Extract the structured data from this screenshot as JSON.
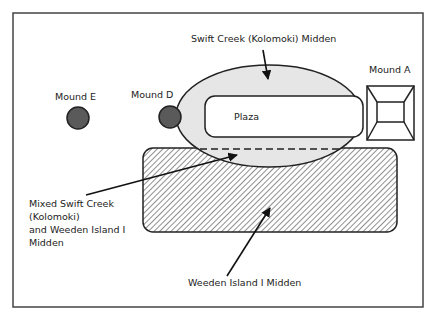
{
  "diagram": {
    "labels": {
      "swift_creek_midden": "Swift Creek (Kolomoki) Midden",
      "mound_a": "Mound A",
      "mound_d": "Mound D",
      "mound_e": "Mound E",
      "plaza": "Plaza",
      "mixed_midden": [
        "Mixed Swift Creek",
        "(Kolomoki)",
        "and Weeden Island I",
        "Midden"
      ],
      "weeden_midden": "Weeden Island I Midden"
    },
    "colors": {
      "frame": "#444444",
      "swift_creek_fill": "#e6e6e6",
      "mound_fill": "#5a5a5a",
      "stroke": "#222222",
      "hatch": "#333333"
    }
  }
}
